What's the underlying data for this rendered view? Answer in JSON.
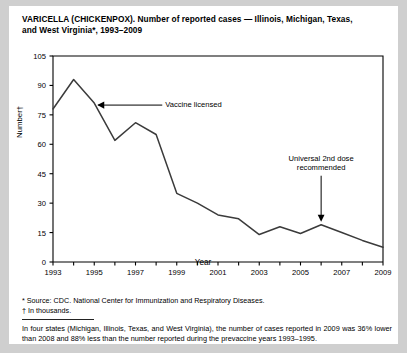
{
  "figure": {
    "title_line1": "VARICELLA (CHICKENPOX). Number of reported cases — Illinois, Michigan, Texas,",
    "title_line2": "and West Virginia*, 1993–2009",
    "footnote_source": "* Source: CDC. National Center for Immunization and Respiratory Diseases.",
    "footnote_units": "† In thousands.",
    "caption": "In four states (Michigan, Illinois, Texas, and West Virginia), the number of cases reported in 2009 was 36% lower than 2008 and 88% less than the number reported during the prevaccine years 1993–1995."
  },
  "chart_data": {
    "type": "line",
    "title": "VARICELLA (CHICKENPOX). Number of reported cases — Illinois, Michigan, Texas, and West Virginia*, 1993–2009",
    "xlabel": "Year",
    "ylabel": "Number†",
    "x": [
      1993,
      1994,
      1995,
      1996,
      1997,
      1998,
      1999,
      2000,
      2001,
      2002,
      2003,
      2004,
      2005,
      2006,
      2007,
      2008,
      2009
    ],
    "values": [
      78,
      93,
      81,
      62,
      71,
      65,
      35,
      30,
      24,
      22,
      14,
      18,
      14.5,
      19,
      15,
      11,
      7.5
    ],
    "series_name": "Reported varicella cases (thousands)",
    "xlim": [
      1993,
      2009
    ],
    "ylim": [
      0,
      105
    ],
    "yticks": [
      0,
      15,
      30,
      45,
      60,
      75,
      90,
      105
    ],
    "ytick_labels": [
      "0",
      "15",
      "30",
      "45",
      "60",
      "75",
      "90",
      "105"
    ],
    "xticks": [
      1993,
      1994,
      1995,
      1996,
      1997,
      1998,
      1999,
      2000,
      2001,
      2002,
      2003,
      2004,
      2005,
      2006,
      2007,
      2008,
      2009
    ],
    "xtick_labels_shown": [
      "1993",
      "1995",
      "1997",
      "1999",
      "2001",
      "2003",
      "2005",
      "2007",
      "2009"
    ],
    "grid": false,
    "legend": "none",
    "line_color": "#3b3b3b",
    "annotations": [
      {
        "text": "Vaccine licensed",
        "points_to_year": 1995,
        "points_to_value": 81,
        "arrow": "left"
      },
      {
        "text_line1": "Universal 2nd dose",
        "text_line2": "recommended",
        "points_to_year": 2006,
        "points_to_value": 19,
        "arrow": "down"
      }
    ]
  }
}
